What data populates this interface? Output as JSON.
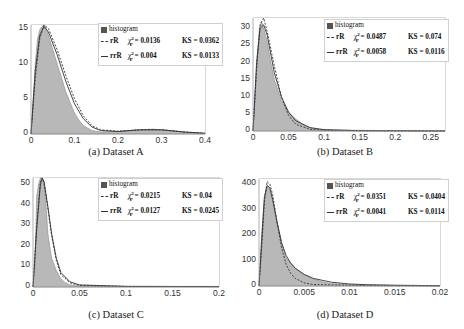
{
  "chart_data": [
    {
      "type": "area",
      "title": "",
      "caption": "(a)  Dataset A",
      "xlabel": "",
      "ylabel": "",
      "xlim": [
        0,
        0.4
      ],
      "ylim": [
        0,
        15.5
      ],
      "xticks": [
        "0",
        "0.1",
        "0.2",
        "0.3",
        "0.4"
      ],
      "yticks": [
        "0",
        "5",
        "10",
        "15"
      ],
      "legend": [
        {
          "label": "histogram"
        },
        {
          "label": "rR",
          "chi": "0.0136",
          "ks": "0.0362"
        },
        {
          "label": "rrR",
          "chi": "0.004",
          "ks": "0.0133"
        }
      ],
      "series": [
        {
          "name": "histogram",
          "x": [
            0,
            0.005,
            0.01,
            0.015,
            0.02,
            0.025,
            0.03,
            0.035,
            0.04,
            0.05,
            0.06,
            0.07,
            0.08,
            0.09,
            0.1,
            0.11,
            0.12,
            0.14,
            0.16,
            0.2,
            0.25,
            0.28,
            0.32,
            0.36,
            0.4
          ],
          "y": [
            0,
            5,
            10,
            13.5,
            14.8,
            15.3,
            15.5,
            15,
            14,
            12,
            10,
            8,
            6,
            4.5,
            3,
            2,
            1.2,
            0.5,
            0.3,
            0.35,
            0.6,
            0.7,
            0.5,
            0.2,
            0.1
          ]
        },
        {
          "name": "rR",
          "x": [
            0,
            0.01,
            0.02,
            0.03,
            0.04,
            0.06,
            0.08,
            0.1,
            0.12,
            0.14,
            0.16,
            0.2,
            0.25,
            0.3,
            0.35,
            0.4
          ],
          "y": [
            0,
            8,
            13.5,
            15.5,
            15,
            12,
            8.3,
            5,
            2.6,
            1.2,
            0.6,
            0.4,
            0.6,
            0.6,
            0.3,
            0.1
          ]
        },
        {
          "name": "rrR",
          "x": [
            0,
            0.01,
            0.02,
            0.03,
            0.04,
            0.06,
            0.08,
            0.1,
            0.12,
            0.14,
            0.16,
            0.2,
            0.25,
            0.3,
            0.35,
            0.4
          ],
          "y": [
            0,
            9,
            14,
            15.3,
            14.5,
            11.3,
            7.5,
            4.3,
            2.2,
            1,
            0.5,
            0.35,
            0.6,
            0.6,
            0.3,
            0.1
          ]
        }
      ]
    },
    {
      "type": "area",
      "title": "",
      "caption": "(b)  Dataset B",
      "xlabel": "",
      "ylabel": "",
      "xlim": [
        0,
        0.27
      ],
      "ylim": [
        0,
        33
      ],
      "xticks": [
        "0",
        "0.05",
        "0.1",
        "0.15",
        "0.2",
        "0.25"
      ],
      "yticks": [
        "0",
        "5",
        "10",
        "15",
        "20",
        "25",
        "30"
      ],
      "legend": [
        {
          "label": "histogram"
        },
        {
          "label": "rR",
          "chi": "0.0487",
          "ks": "0.074"
        },
        {
          "label": "rrR",
          "chi": "0.0058",
          "ks": "0.0116"
        }
      ],
      "series": [
        {
          "name": "histogram",
          "x": [
            0,
            0.003,
            0.006,
            0.009,
            0.012,
            0.015,
            0.02,
            0.025,
            0.03,
            0.04,
            0.05,
            0.06,
            0.07,
            0.08,
            0.09,
            0.1,
            0.15,
            0.2,
            0.27
          ],
          "y": [
            0,
            10,
            22,
            30,
            32,
            30,
            26,
            20,
            15,
            9,
            5.5,
            3.5,
            2,
            1,
            0.5,
            0.3,
            0.2,
            0.1,
            0.1
          ]
        },
        {
          "name": "rR",
          "x": [
            0,
            0.005,
            0.01,
            0.015,
            0.02,
            0.03,
            0.04,
            0.05,
            0.06,
            0.08,
            0.1,
            0.15,
            0.2,
            0.27
          ],
          "y": [
            0,
            18,
            31,
            33,
            29,
            19,
            10,
            4.5,
            2,
            0.5,
            0.2,
            0.1,
            0.05,
            0
          ]
        },
        {
          "name": "rrR",
          "x": [
            0,
            0.005,
            0.01,
            0.015,
            0.02,
            0.03,
            0.04,
            0.05,
            0.06,
            0.08,
            0.1,
            0.15,
            0.2,
            0.27
          ],
          "y": [
            0,
            20,
            30,
            31,
            28,
            17,
            10,
            5.5,
            3,
            1,
            0.4,
            0.1,
            0.05,
            0
          ]
        }
      ]
    },
    {
      "type": "area",
      "title": "",
      "caption": "(c)  Dataset C",
      "xlabel": "",
      "ylabel": "",
      "xlim": [
        0,
        0.2
      ],
      "ylim": [
        0,
        53
      ],
      "xticks": [
        "0",
        "0.05",
        "0.1",
        "0.15",
        "0.2"
      ],
      "yticks": [
        "0",
        "10",
        "20",
        "30",
        "40",
        "50"
      ],
      "legend": [
        {
          "label": "histogram"
        },
        {
          "label": "rR",
          "chi": "0.0215",
          "ks": "0.04"
        },
        {
          "label": "rrR",
          "chi": "0.0127",
          "ks": "0.0245"
        }
      ],
      "series": [
        {
          "name": "histogram",
          "x": [
            0,
            0.002,
            0.004,
            0.006,
            0.008,
            0.01,
            0.012,
            0.014,
            0.016,
            0.018,
            0.02,
            0.025,
            0.03,
            0.035,
            0.04,
            0.05,
            0.1,
            0.15,
            0.2
          ],
          "y": [
            0,
            10,
            44,
            50,
            53,
            53,
            50,
            40,
            26,
            20,
            14,
            8,
            4,
            2,
            1,
            0.5,
            0.3,
            0.3,
            0.3
          ]
        },
        {
          "name": "rR",
          "x": [
            0,
            0.004,
            0.008,
            0.01,
            0.012,
            0.016,
            0.02,
            0.025,
            0.03,
            0.04,
            0.05,
            0.1,
            0.2
          ],
          "y": [
            0,
            30,
            51,
            53,
            50,
            38,
            25,
            13,
            6,
            2,
            0.8,
            0.3,
            0.2
          ]
        },
        {
          "name": "rrR",
          "x": [
            0,
            0.004,
            0.008,
            0.01,
            0.012,
            0.016,
            0.02,
            0.025,
            0.03,
            0.04,
            0.05,
            0.1,
            0.2
          ],
          "y": [
            0,
            28,
            50,
            53,
            51,
            39,
            26,
            14,
            7,
            2.5,
            1,
            0.3,
            0.2
          ]
        }
      ]
    },
    {
      "type": "area",
      "title": "",
      "caption": "(d)  Dataset D",
      "xlabel": "",
      "ylabel": "",
      "xlim": [
        0,
        0.02
      ],
      "ylim": [
        0,
        420
      ],
      "xticks": [
        "0",
        "0.005",
        "0.01",
        "0.015",
        "0.02"
      ],
      "yticks": [
        "0",
        "100",
        "200",
        "300",
        "400"
      ],
      "legend": [
        {
          "label": "histogram"
        },
        {
          "label": "rR",
          "chi": "0.0351",
          "ks": "0.0404"
        },
        {
          "label": "rrR",
          "chi": "0.0041",
          "ks": "0.0114"
        }
      ],
      "series": [
        {
          "name": "histogram",
          "x": [
            0,
            0.0003,
            0.0006,
            0.0009,
            0.0012,
            0.0015,
            0.002,
            0.0025,
            0.003,
            0.0035,
            0.004,
            0.005,
            0.006,
            0.007,
            0.008,
            0.01,
            0.012,
            0.015,
            0.02
          ],
          "y": [
            0,
            200,
            340,
            390,
            380,
            340,
            250,
            170,
            110,
            90,
            70,
            45,
            28,
            17,
            10,
            5,
            3,
            2,
            1
          ]
        },
        {
          "name": "rR",
          "x": [
            0,
            0.0003,
            0.0006,
            0.0009,
            0.0012,
            0.0015,
            0.002,
            0.0025,
            0.003,
            0.0035,
            0.004,
            0.005,
            0.006,
            0.008,
            0.01,
            0.012,
            0.015,
            0.02
          ],
          "y": [
            0,
            150,
            330,
            410,
            400,
            360,
            250,
            150,
            85,
            50,
            30,
            12,
            6,
            4,
            3,
            2,
            1,
            0
          ]
        },
        {
          "name": "rrR",
          "x": [
            0,
            0.0003,
            0.0006,
            0.0009,
            0.0012,
            0.0015,
            0.002,
            0.0025,
            0.003,
            0.0035,
            0.004,
            0.005,
            0.006,
            0.008,
            0.01,
            0.012,
            0.015,
            0.02
          ],
          "y": [
            0,
            180,
            350,
            395,
            385,
            340,
            250,
            170,
            120,
            90,
            70,
            45,
            30,
            15,
            8,
            5,
            3,
            1
          ]
        }
      ]
    }
  ],
  "layout": [
    {
      "plot": {
        "left": 31,
        "top": 24,
        "width": 174,
        "height": 109
      },
      "caption_x": 116,
      "caption_y": 146
    },
    {
      "plot": {
        "left": 253,
        "top": 17,
        "width": 192,
        "height": 113
      },
      "caption_x": 345,
      "caption_y": 146
    },
    {
      "plot": {
        "left": 33,
        "top": 177,
        "width": 186,
        "height": 109
      },
      "caption_x": 116,
      "caption_y": 309
    },
    {
      "plot": {
        "left": 259,
        "top": 178,
        "width": 181,
        "height": 107
      },
      "caption_x": 345,
      "caption_y": 309
    }
  ],
  "legend_boxes": [
    {
      "left": 98,
      "top": 23
    },
    {
      "left": 324,
      "top": 19
    },
    {
      "left": 98,
      "top": 178
    },
    {
      "left": 324,
      "top": 179
    }
  ],
  "legend_symbols": {
    "chi": "χ",
    "chi_sup": "2",
    "chi_sub": "P",
    "ks": "KS"
  },
  "colors": {
    "hist_fill": "#b8b8b8",
    "hist_edge": "#8a8a8a",
    "fit_line": "#333333",
    "axis": "#999999"
  }
}
